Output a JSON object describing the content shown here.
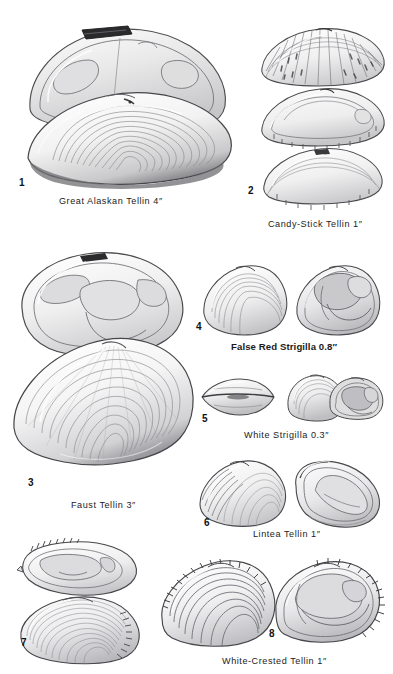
{
  "plate": {
    "background_color": "#ffffff",
    "ink_color": "#1b1b1b",
    "width": 393,
    "height": 674,
    "subject": "Tellin and Strigilla bivalve shells"
  },
  "figures": [
    {
      "number": "1",
      "caption": "Great Alaskan Tellin 4″",
      "common_name": "Great Alaskan Tellin",
      "size": "4″",
      "views": 2,
      "view_types": [
        "interior valve",
        "exterior valve"
      ]
    },
    {
      "number": "2",
      "caption": "Candy-Stick Tellin 1″",
      "common_name": "Candy-Stick Tellin",
      "size": "1″",
      "views": 3,
      "view_types": [
        "exterior rayed",
        "interior",
        "exterior plain"
      ]
    },
    {
      "number": "3",
      "caption": "Faust Tellin 3″",
      "common_name": "Faust Tellin",
      "size": "3″",
      "views": 2,
      "view_types": [
        "interior valve",
        "exterior valve"
      ]
    },
    {
      "number": "4",
      "caption": "False Red Strigilla 0.8″",
      "common_name": "False Red Strigilla",
      "size": "0.8″",
      "views": 2,
      "view_types": [
        "exterior",
        "interior"
      ]
    },
    {
      "number": "5",
      "caption": "White  Strigilla 0.3″",
      "common_name": "White Strigilla",
      "size": "0.3″",
      "views": 3,
      "view_types": [
        "dorsal",
        "exterior",
        "interior"
      ]
    },
    {
      "number": "6",
      "caption": "Lintea Tellin  1″",
      "common_name": "Lintea Tellin",
      "size": "1″",
      "views": 2,
      "view_types": [
        "exterior",
        "interior"
      ]
    },
    {
      "number": "7",
      "caption": "",
      "common_name": "",
      "size": "",
      "views": 2,
      "view_types": [
        "interior valve",
        "exterior valve"
      ]
    },
    {
      "number": "8",
      "caption": "White-Crested Tellin  1″",
      "common_name": "White-Crested Tellin",
      "size": "1″",
      "views": 2,
      "view_types": [
        "exterior",
        "interior"
      ]
    }
  ]
}
